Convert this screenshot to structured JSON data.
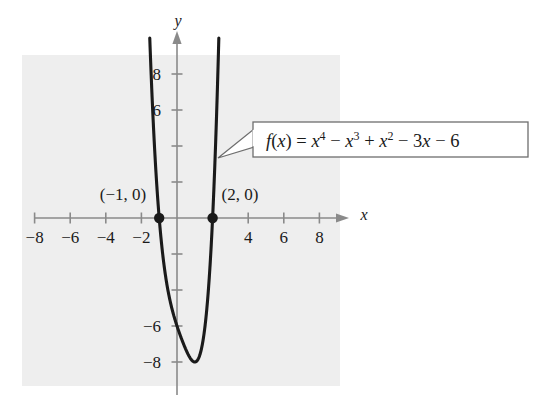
{
  "figure": {
    "background_color": "#ffffff",
    "panel_color": "#eeeeee",
    "axis_color": "#8a8a8a",
    "curve_color": "#1a1a1a",
    "label_color": "#1a1a1a",
    "callout_box_fill": "#ffffff",
    "callout_box_border": "#6e6e6e"
  },
  "axes": {
    "x_axis_label": "x",
    "y_axis_label": "y",
    "x_ticks": [
      {
        "value": -8,
        "label": "−8"
      },
      {
        "value": -6,
        "label": "−6"
      },
      {
        "value": -4,
        "label": "−4"
      },
      {
        "value": -2,
        "label": "−2"
      },
      {
        "value": 2,
        "label": ""
      },
      {
        "value": 4,
        "label": "4"
      },
      {
        "value": 6,
        "label": "6"
      },
      {
        "value": 8,
        "label": "8"
      }
    ],
    "y_ticks": [
      {
        "value": 8,
        "label": "8"
      },
      {
        "value": 6,
        "label": "6"
      },
      {
        "value": 4,
        "label": ""
      },
      {
        "value": 2,
        "label": ""
      },
      {
        "value": -2,
        "label": ""
      },
      {
        "value": -4,
        "label": ""
      },
      {
        "value": -6,
        "label": "−6"
      },
      {
        "value": -8,
        "label": "−8"
      }
    ]
  },
  "callout": {
    "equation_text": "f(x) = x⁴ − x³ + x² − 3x − 6",
    "equation_parts": {
      "fx": "f(x)",
      "equals": "=",
      "term1_base": "x",
      "term1_exp": "4",
      "op1": "−",
      "term2_base": "x",
      "term2_exp": "3",
      "op2": "+",
      "term3_base": "x",
      "term3_exp": "2",
      "op3": "−",
      "term4": "3x",
      "op4": "−",
      "term5": "6"
    }
  },
  "point_labels": [
    {
      "name": "left-root",
      "text": "(−1, 0)",
      "x": -1,
      "y": 0
    },
    {
      "name": "right-root",
      "text": "(2, 0)",
      "x": 2,
      "y": 0
    }
  ],
  "chart_data": {
    "type": "line",
    "title": "",
    "xlabel": "x",
    "ylabel": "y",
    "grid": false,
    "legend": "none",
    "function": "f(x) = x^4 - x^3 + x^2 - 3x - 6",
    "coefficients": {
      "x4": 1,
      "x3": -1,
      "x2": 1,
      "x1": -3,
      "x0": -6
    },
    "xlim": [
      -9.2,
      9.2
    ],
    "ylim": [
      -9.6,
      9.6
    ],
    "x_tick_values": [
      -8,
      -6,
      -4,
      -2,
      2,
      4,
      6,
      8
    ],
    "y_tick_values": [
      8,
      6,
      4,
      2,
      -2,
      -4,
      -6,
      -8
    ],
    "roots": [
      {
        "x": -1,
        "y": 0
      },
      {
        "x": 2,
        "y": 0
      }
    ],
    "marked_points": [
      {
        "x": -1,
        "y": 0,
        "label": "(−1, 0)"
      },
      {
        "x": 2,
        "y": 0,
        "label": "(2, 0)"
      }
    ],
    "minimum": {
      "x": 1.05,
      "y": -7.7
    },
    "series": [
      {
        "name": "f(x) = x^4 - x^3 + x^2 - 3x - 6",
        "x": [
          -1.75,
          -1.7,
          -1.6,
          -1.5,
          -1.4,
          -1.3,
          -1.2,
          -1.1,
          -1.0,
          -0.9,
          -0.8,
          -0.6,
          -0.4,
          -0.2,
          0.0,
          0.2,
          0.4,
          0.6,
          0.8,
          1.0,
          1.2,
          1.4,
          1.6,
          1.8,
          2.0,
          2.1,
          2.2,
          2.3,
          2.4,
          2.5,
          2.55
        ],
        "y": [
          14.96,
          13.1,
          9.79,
          7.03,
          4.76,
          2.92,
          1.46,
          0.33,
          0.0,
          -0.87,
          -1.55,
          -2.66,
          -3.42,
          -3.87,
          -6.0,
          -6.55,
          -7.03,
          -7.41,
          -7.67,
          -7.78,
          -7.71,
          -7.4,
          -6.8,
          -5.83,
          -4.0,
          -2.75,
          -1.23,
          0.6,
          2.77,
          5.31,
          6.73
        ]
      }
    ]
  }
}
